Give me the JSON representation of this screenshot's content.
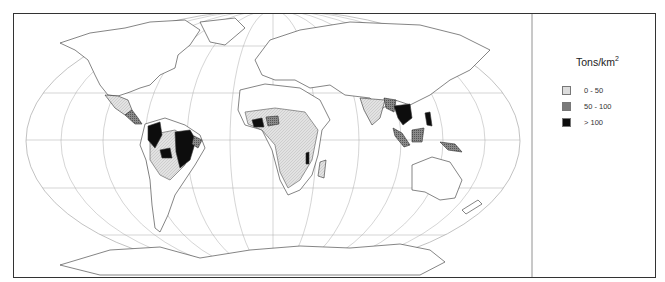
{
  "legend": {
    "title": "Tons/km",
    "title_superscript": "2",
    "items": [
      {
        "label": "0 - 50",
        "color": "#dcdcdc",
        "category": "low"
      },
      {
        "label": "50 - 100",
        "color": "#7a7a7a",
        "category": "medium"
      },
      {
        "label": "> 100",
        "color": "#0d0d0d",
        "category": "high"
      }
    ]
  },
  "map": {
    "projection": "Robinson-like world map",
    "graticule": true,
    "regions": {
      "high": [
        "Colombia/Venezuela",
        "Amazon Brazil",
        "Bolivia",
        "Peru",
        "Ivory Coast/Ghana",
        "Malawi",
        "Thailand/Myanmar",
        "Philippines",
        "Borneo",
        "Vietnam"
      ],
      "medium": [
        "Central America",
        "Nigeria",
        "Bangladesh/Burma",
        "Sumatra",
        "Papua New Guinea",
        "Guyana region"
      ],
      "low": [
        "Mexico",
        "Southern South America",
        "Sub-Saharan Africa",
        "India",
        "Madagascar"
      ]
    }
  }
}
